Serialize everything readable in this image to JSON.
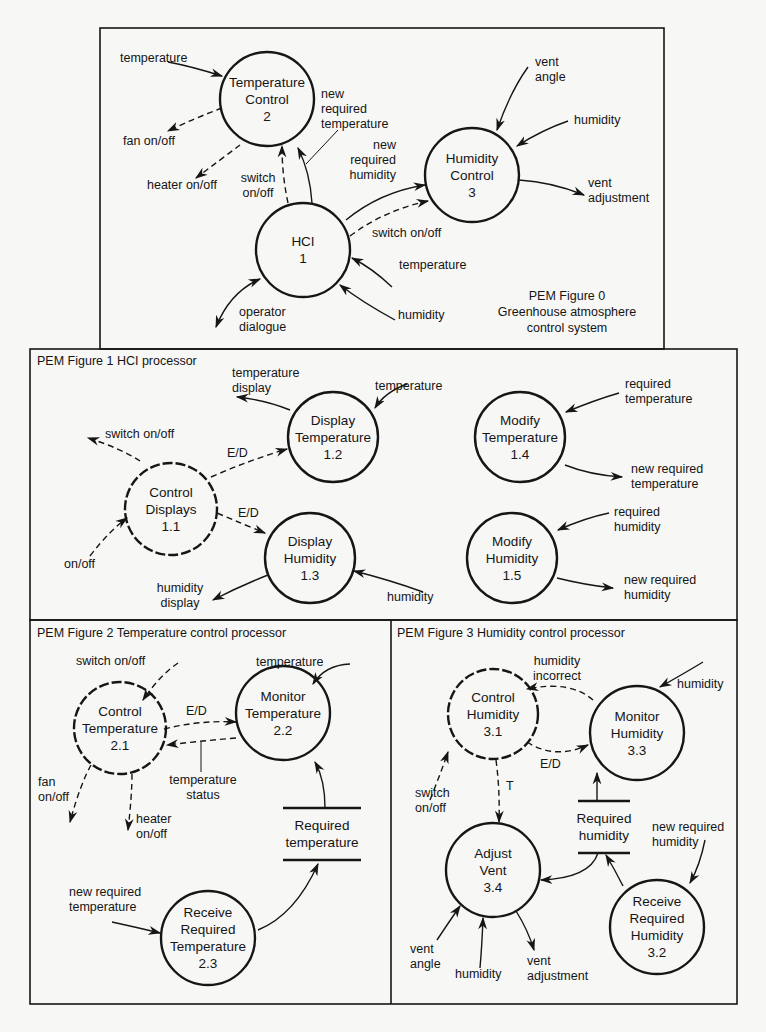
{
  "fig0": {
    "caption_title": "PEM Figure 0",
    "caption_line1": "Greenhouse atmosphere",
    "caption_line2": "control system",
    "nodes": {
      "tc": {
        "l1": "Temperature",
        "l2": "Control",
        "num": "2"
      },
      "hc": {
        "l1": "Humidity",
        "l2": "Control",
        "num": "3"
      },
      "hci": {
        "l1": "HCI",
        "num": "1"
      }
    },
    "flows": {
      "temperature_in": "temperature",
      "fan": "fan on/off",
      "heater": "heater on/off",
      "new_req_temp": [
        "new",
        "required",
        "temperature"
      ],
      "new_req_hum": [
        "new",
        "required",
        "humidity"
      ],
      "switch_tc": [
        "switch",
        "on/off"
      ],
      "switch_hc": "switch on/off",
      "vent_angle": [
        "vent",
        "angle"
      ],
      "humidity_hc": "humidity",
      "vent_adj": [
        "vent",
        "adjustment"
      ],
      "temperature_hci": "temperature",
      "humidity_hci": "humidity",
      "operator": [
        "operator",
        "dialogue"
      ]
    }
  },
  "fig1": {
    "title": "PEM Figure 1  HCI processor",
    "nodes": {
      "cd": {
        "l1": "Control",
        "l2": "Displays",
        "num": "1.1"
      },
      "dt": {
        "l1": "Display",
        "l2": "Temperature",
        "num": "1.2"
      },
      "dh": {
        "l1": "Display",
        "l2": "Humidity",
        "num": "1.3"
      },
      "mt": {
        "l1": "Modify",
        "l2": "Temperature",
        "num": "1.4"
      },
      "mh": {
        "l1": "Modify",
        "l2": "Humidity",
        "num": "1.5"
      }
    },
    "flows": {
      "temp_display": [
        "temperature",
        "display"
      ],
      "temperature": "temperature",
      "switch": "switch on/off",
      "ed1": "E/D",
      "ed2": "E/D",
      "onoff": "on/off",
      "hum_display": [
        "humidity",
        "display"
      ],
      "humidity": "humidity",
      "req_temp": [
        "required",
        "temperature"
      ],
      "new_req_temp": [
        "new required",
        "temperature"
      ],
      "req_hum": [
        "required",
        "humidity"
      ],
      "new_req_hum": [
        "new required",
        "humidity"
      ]
    }
  },
  "fig2": {
    "title": "PEM Figure 2  Temperature control processor",
    "nodes": {
      "ct": {
        "l1": "Control",
        "l2": "Temperature",
        "num": "2.1"
      },
      "mt": {
        "l1": "Monitor",
        "l2": "Temperature",
        "num": "2.2"
      },
      "rrt": {
        "l1": "Receive",
        "l2": "Required",
        "l3": "Temperature",
        "num": "2.3"
      }
    },
    "store": {
      "l1": "Required",
      "l2": "temperature"
    },
    "flows": {
      "switch": "switch on/off",
      "temperature": "temperature",
      "ed": "E/D",
      "temp_status": [
        "temperature",
        "status"
      ],
      "fan": [
        "fan",
        "on/off"
      ],
      "heater": [
        "heater",
        "on/off"
      ],
      "new_req_temp": [
        "new required",
        "temperature"
      ]
    }
  },
  "fig3": {
    "title": "PEM Figure 3  Humidity control processor",
    "nodes": {
      "ch": {
        "l1": "Control",
        "l2": "Humidity",
        "num": "3.1"
      },
      "mh": {
        "l1": "Monitor",
        "l2": "Humidity",
        "num": "3.3"
      },
      "av": {
        "l1": "Adjust",
        "l2": "Vent",
        "num": "3.4"
      },
      "rrh": {
        "l1": "Receive",
        "l2": "Required",
        "l3": "Humidity",
        "num": "3.2"
      }
    },
    "store": {
      "l1": "Required",
      "l2": "humidity"
    },
    "flows": {
      "hum_incorrect": [
        "humidity",
        "incorrect"
      ],
      "humidity": "humidity",
      "ed": "E/D",
      "t": "T",
      "switch": [
        "switch",
        "on/off"
      ],
      "new_req_hum": [
        "new required",
        "humidity"
      ],
      "vent_angle": [
        "vent",
        "angle"
      ],
      "humidity_av": "humidity",
      "vent_adj": [
        "vent",
        "adjustment"
      ]
    }
  }
}
